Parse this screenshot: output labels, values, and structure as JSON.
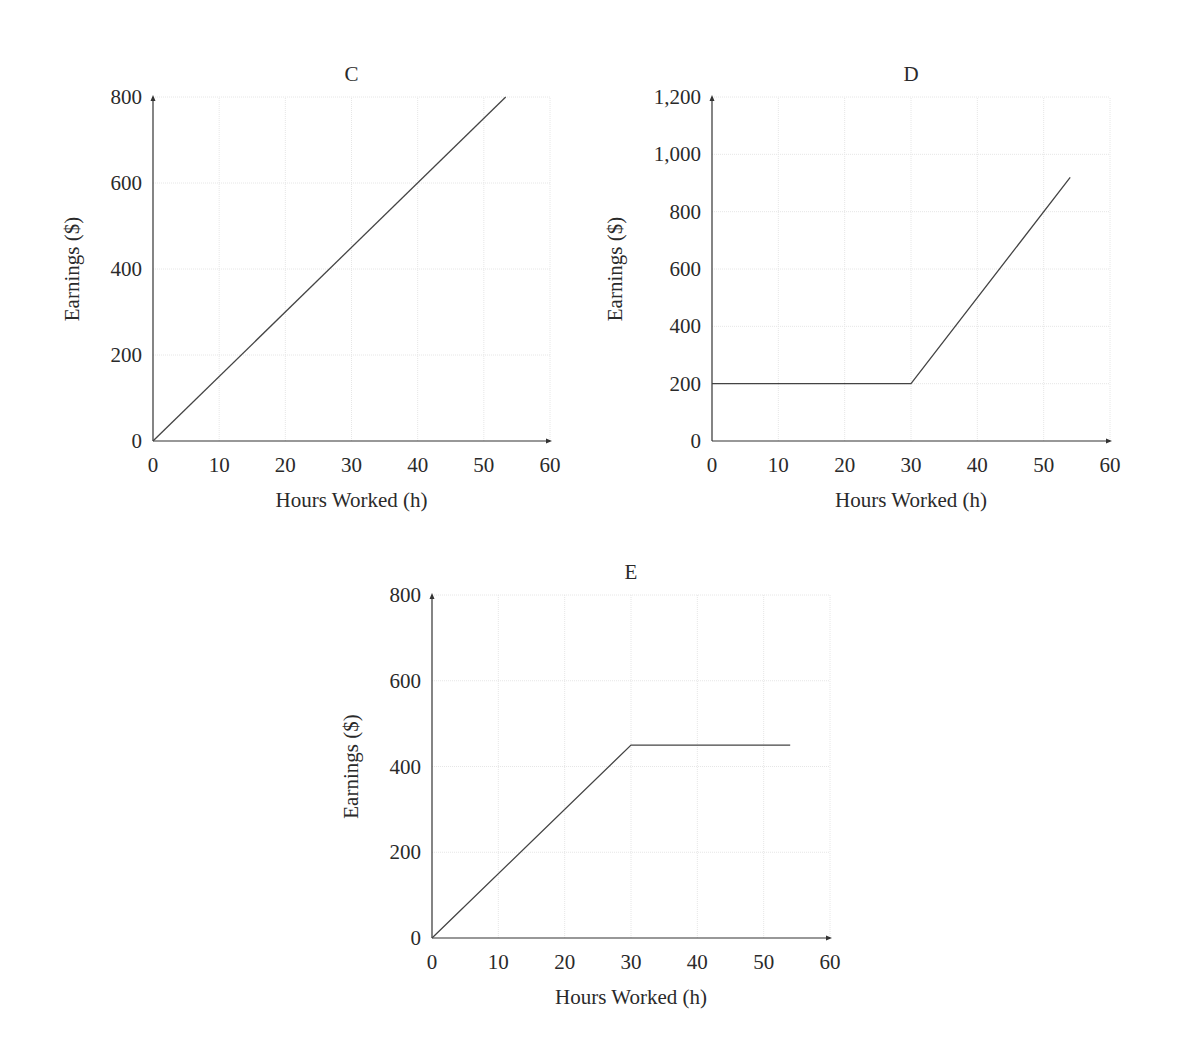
{
  "figure": {
    "panels": [
      {
        "id": "C",
        "title": "C",
        "xlabel": "Hours Worked (h)",
        "ylabel": "Earnings ($)",
        "xticks": [
          "0",
          "10",
          "20",
          "30",
          "40",
          "50",
          "60"
        ],
        "yticks": [
          "0",
          "200",
          "400",
          "600",
          "800"
        ]
      },
      {
        "id": "D",
        "title": "D",
        "xlabel": "Hours Worked (h)",
        "ylabel": "Earnings ($)",
        "xticks": [
          "0",
          "10",
          "20",
          "30",
          "40",
          "50",
          "60"
        ],
        "yticks": [
          "0",
          "200",
          "400",
          "600",
          "800",
          "1,000",
          "1,200"
        ]
      },
      {
        "id": "E",
        "title": "E",
        "xlabel": "Hours Worked (h)",
        "ylabel": "Earnings ($)",
        "xticks": [
          "0",
          "10",
          "20",
          "30",
          "40",
          "50",
          "60"
        ],
        "yticks": [
          "0",
          "200",
          "400",
          "600",
          "800"
        ]
      }
    ]
  },
  "chart_data": [
    {
      "type": "line",
      "title": "C",
      "xlabel": "Hours Worked (h)",
      "ylabel": "Earnings ($)",
      "xlim": [
        0,
        60
      ],
      "ylim": [
        0,
        800
      ],
      "grid": true,
      "series": [
        {
          "name": "C",
          "x": [
            0,
            53.3
          ],
          "y": [
            0,
            800
          ]
        }
      ]
    },
    {
      "type": "line",
      "title": "D",
      "xlabel": "Hours Worked (h)",
      "ylabel": "Earnings ($)",
      "xlim": [
        0,
        60
      ],
      "ylim": [
        0,
        1200
      ],
      "grid": true,
      "series": [
        {
          "name": "D",
          "x": [
            0,
            30,
            54
          ],
          "y": [
            200,
            200,
            920
          ]
        }
      ]
    },
    {
      "type": "line",
      "title": "E",
      "xlabel": "Hours Worked (h)",
      "ylabel": "Earnings ($)",
      "xlim": [
        0,
        60
      ],
      "ylim": [
        0,
        800
      ],
      "grid": true,
      "series": [
        {
          "name": "E",
          "x": [
            0,
            30,
            54
          ],
          "y": [
            0,
            450,
            450
          ]
        }
      ]
    }
  ]
}
